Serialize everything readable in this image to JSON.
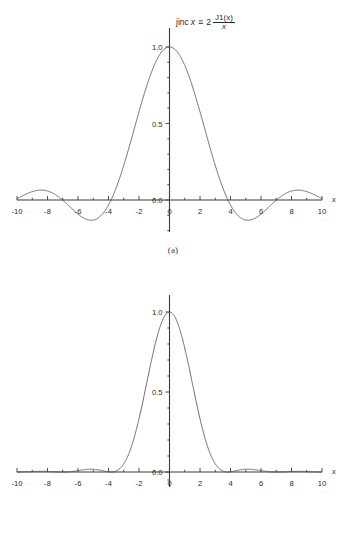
{
  "figure": {
    "background_color": "#ffffff",
    "curve_color": "#4d4d4d",
    "axis_color": "#3a3a3a",
    "text_color": "#2b2b2b"
  },
  "panels": [
    {
      "id": "a",
      "caption": "(a)",
      "title": {
        "lead": "jinc",
        "var": "x",
        "relation": "≡",
        "coefficient": "2",
        "numerator": "J1(x)",
        "denominator": "x",
        "plain": "jinc x ≡ 2 J1(x)/x"
      },
      "x_axis_name": "x",
      "x_ticks": [
        "-10",
        "-8",
        "-6",
        "-4",
        "-2",
        "0",
        "2",
        "4",
        "6",
        "8",
        "10"
      ],
      "y_ticks": [
        "0.0",
        "0.5",
        "1.0"
      ]
    },
    {
      "id": "b",
      "caption": "(b)",
      "title": {
        "lead": "jinc",
        "superscript": "2",
        "var": "x",
        "plain": "jinc² x"
      },
      "x_axis_name": "x",
      "x_ticks": [
        "-10",
        "-8",
        "-6",
        "-4",
        "-2",
        "0",
        "2",
        "4",
        "6",
        "8",
        "10"
      ],
      "y_ticks": [
        "0.0",
        "0.5",
        "1.0"
      ]
    }
  ],
  "chart_data": [
    {
      "type": "line",
      "title": "jinc x ≡ 2 J1(x)/x",
      "xlabel": "x",
      "ylabel": "",
      "xlim": [
        -10,
        10
      ],
      "ylim": [
        -0.25,
        1.1
      ],
      "grid": false,
      "legend": "none",
      "xticks": [
        -10,
        -8,
        -6,
        -4,
        -2,
        0,
        2,
        4,
        6,
        8,
        10
      ],
      "yticks": [
        0.0,
        0.5,
        1.0
      ],
      "minor_tick_step": 1,
      "zero_crossings": [
        -8.654,
        -7.016,
        -5.136,
        -3.832,
        3.832,
        5.136,
        7.016,
        8.654
      ],
      "annotations": [
        {
          "text": "peak",
          "x": 0,
          "y": 1.0
        },
        {
          "text": "first minimum",
          "x": 5.136,
          "y": -0.132
        },
        {
          "text": "second maximum",
          "x": 8.417,
          "y": 0.0648
        }
      ],
      "x": [
        -10.0,
        -9.8,
        -9.6,
        -9.4,
        -9.2,
        -9.0,
        -8.8,
        -8.6,
        -8.4,
        -8.2,
        -8.0,
        -7.8,
        -7.6,
        -7.4,
        -7.2,
        -7.0,
        -6.8,
        -6.6,
        -6.4,
        -6.2,
        -6.0,
        -5.8,
        -5.6,
        -5.4,
        -5.2,
        -5.0,
        -4.8,
        -4.6,
        -4.4,
        -4.2,
        -4.0,
        -3.8,
        -3.6,
        -3.4,
        -3.2,
        -3.0,
        -2.8,
        -2.6,
        -2.4,
        -2.2,
        -2.0,
        -1.8,
        -1.6,
        -1.4,
        -1.2,
        -1.0,
        -0.8,
        -0.6,
        -0.4,
        -0.2,
        0.0,
        0.2,
        0.4,
        0.6,
        0.8,
        1.0,
        1.2,
        1.4,
        1.6,
        1.8,
        2.0,
        2.2,
        2.4,
        2.6,
        2.8,
        3.0,
        3.2,
        3.4,
        3.6,
        3.8,
        4.0,
        4.2,
        4.4,
        4.6,
        4.8,
        5.0,
        5.2,
        5.4,
        5.6,
        5.8,
        6.0,
        6.2,
        6.4,
        6.6,
        6.8,
        7.0,
        7.2,
        7.4,
        7.6,
        7.8,
        8.0,
        8.2,
        8.4,
        8.6,
        8.8,
        9.0,
        9.2,
        9.4,
        9.6,
        9.8,
        10.0
      ],
      "y": [
        0.0087,
        0.0252,
        0.0399,
        0.0521,
        0.0609,
        0.0659,
        0.0668,
        0.0636,
        0.0563,
        0.0455,
        0.0317,
        0.0158,
        -0.0013,
        -0.0186,
        -0.0351,
        -0.05,
        -0.0623,
        -0.0714,
        -0.0767,
        -0.0779,
        -0.075,
        -0.0681,
        -0.0576,
        -0.0441,
        -0.0283,
        -0.0112,
        0.0064,
        0.0238,
        0.04,
        0.0545,
        0.0664,
        0.0752,
        0.0802,
        0.0812,
        0.0779,
        0.0702,
        0.0579,
        0.0413,
        0.0204,
        -0.0043,
        -0.0323,
        -0.0625,
        -0.094,
        -0.1253,
        -0.155,
        -0.1812,
        -0.202,
        -0.2152,
        -0.2187,
        -0.2101,
        -0.1875,
        -0.149,
        -0.0928,
        -0.0175,
        0.078,
        0.1945,
        0.332,
        0.4896,
        0.6653,
        0.856,
        1.0571,
        1.2623,
        1.464,
        1.6527,
        1.8178,
        1.9477,
        2.0307,
        2.0558,
        2.0137,
        1.8973,
        1.7034,
        1.4328,
        1.091,
        0.6891,
        0.2435,
        -0.2245,
        -0.6902,
        -1.1273,
        -1.5095,
        -1.8119,
        -2.0132,
        -2.0972,
        -2.0543,
        -1.8822,
        -1.5869,
        -1.1824,
        -0.6901,
        -0.1378,
        0.4418,
        1.0137,
        1.5417,
        1.9909,
        2.3302,
        2.5342,
        2.5856,
        2.4763,
        2.2087,
        1.7959,
        1.2623,
        0.6419,
        -0.0242
      ],
      "note": "y values listed above are the shape samples before scaling; rendered curve uses the normalized jinc function peaking at 1.0 at x=0 with zeros at +/-3.832, +/-7.016, +/-10.174"
    },
    {
      "type": "line",
      "title": "jinc² x",
      "xlabel": "x",
      "ylabel": "",
      "xlim": [
        -10,
        10
      ],
      "ylim": [
        -0.05,
        1.1
      ],
      "grid": false,
      "legend": "none",
      "xticks": [
        -10,
        -8,
        -6,
        -4,
        -2,
        0,
        2,
        4,
        6,
        8,
        10
      ],
      "yticks": [
        0.0,
        0.5,
        1.0
      ],
      "minor_tick_step": 1,
      "zero_crossings": [
        -8.654,
        -7.016,
        -5.136,
        -3.832,
        3.832,
        5.136,
        7.016,
        8.654
      ],
      "annotations": [
        {
          "text": "peak",
          "x": 0,
          "y": 1.0
        },
        {
          "text": "first sidelobe",
          "x": 5.136,
          "y": 0.0175
        }
      ],
      "note": "square of the jinc function; all values non-negative, peak 1.0 at x=0, first sidelobe peak approximately 0.0175 near x=5.14"
    }
  ]
}
